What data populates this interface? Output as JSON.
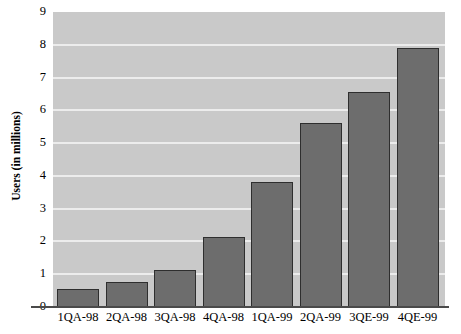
{
  "chart_data": {
    "type": "bar",
    "title": "",
    "xlabel": "",
    "ylabel": "Users (in millions)",
    "categories": [
      "1QA-98",
      "2QA-98",
      "3QA-98",
      "4QA-98",
      "1QA-99",
      "2QA-99",
      "3QE-99",
      "4QE-99"
    ],
    "values": [
      0.55,
      0.77,
      1.13,
      2.15,
      3.8,
      5.6,
      6.55,
      7.9
    ],
    "ylim": [
      0,
      9
    ],
    "ytick_labels": [
      "0",
      "1",
      "2",
      "3",
      "4",
      "5",
      "6",
      "7",
      "8",
      "9"
    ],
    "ytick_values": [
      0,
      1,
      2,
      3,
      4,
      5,
      6,
      7,
      8,
      9
    ],
    "grid": true,
    "legend": "none",
    "colors": {
      "bar_fill": "#6d6d6d",
      "bar_border": "#2e2e2e",
      "plot_background": "#c9c9c9",
      "gridline": "#ececec",
      "axis": "#4a4a4a",
      "canvas": "#ffffff",
      "text": "#000000"
    }
  }
}
